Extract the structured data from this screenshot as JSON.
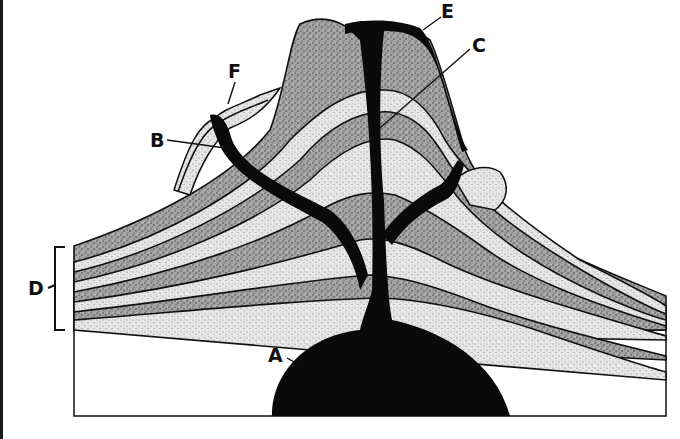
{
  "diagram": {
    "type": "volcano cross-section",
    "labels": [
      {
        "id": "A",
        "text": "A",
        "points_to": "magma chamber"
      },
      {
        "id": "B",
        "text": "B",
        "points_to": "side vent / branch pipe"
      },
      {
        "id": "C",
        "text": "C",
        "points_to": "central vent region"
      },
      {
        "id": "D",
        "text": "D",
        "points_to": "alternating rock layers (bracket)"
      },
      {
        "id": "E",
        "text": "E",
        "points_to": "lava flow on slope"
      },
      {
        "id": "F",
        "text": "F",
        "points_to": "side flow layers"
      }
    ],
    "colors": {
      "magma": "#0a0a0a",
      "dark_layer": "#9a9a9a",
      "light_layer": "#dcdcdc",
      "outline": "#111111",
      "background": "#ffffff"
    }
  }
}
